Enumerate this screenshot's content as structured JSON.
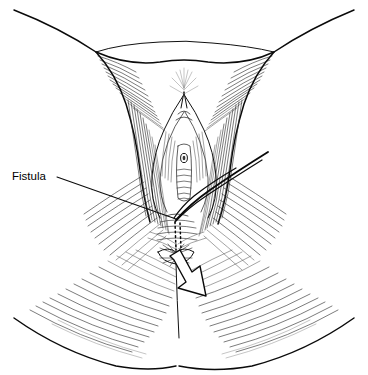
{
  "figure": {
    "domain": "medical-illustration",
    "style": "pen-and-ink line drawing, black on white",
    "title_visible": "",
    "background_color": "#ffffff",
    "ink_color": "#0a0a0a",
    "width_px": 368,
    "height_px": 375
  },
  "annotations": {
    "labels": [
      {
        "id": "fistula",
        "text": "Fistula",
        "text_x": 12,
        "text_y": 177,
        "font_size_px": 11.5,
        "color": "#000000",
        "leader_from_x": 57,
        "leader_from_y": 177,
        "leader_to_x": 176,
        "leader_to_y": 219
      }
    ],
    "arrow": {
      "id": "fistula-tract-arrow",
      "description": "hollow outlined arrow indicating fistula tract direction",
      "points_toward": "down-right",
      "tip_x": 206,
      "tip_y": 296,
      "tail_x": 172,
      "tail_y": 258,
      "fill": "#ffffff",
      "stroke": "#0a0a0a"
    },
    "tract": {
      "id": "fistula-tract",
      "description": "dotted line marking the subcutaneous fistula tract",
      "style": "dotted",
      "x": 176,
      "y_top": 222,
      "y_bottom": 250
    }
  },
  "anatomy": {
    "regions": [
      {
        "id": "mons-pubis",
        "label": "mons pubis",
        "cx": 184,
        "cy": 70
      },
      {
        "id": "left-thigh",
        "label": "left inner thigh",
        "cx": 70,
        "cy": 150
      },
      {
        "id": "right-thigh",
        "label": "right inner thigh",
        "cx": 296,
        "cy": 150
      },
      {
        "id": "labia-majora",
        "label": "labia majora",
        "cx": 184,
        "cy": 170
      },
      {
        "id": "vestibule",
        "label": "vaginal vestibule",
        "cx": 180,
        "cy": 185
      },
      {
        "id": "perineum",
        "label": "perineal body",
        "cx": 178,
        "cy": 235
      },
      {
        "id": "anus",
        "label": "anal verge",
        "cx": 176,
        "cy": 258
      },
      {
        "id": "left-buttock",
        "label": "left buttock",
        "cx": 95,
        "cy": 310
      },
      {
        "id": "right-buttock",
        "label": "right buttock",
        "cx": 270,
        "cy": 310
      }
    ],
    "instrument": {
      "id": "probe",
      "label": "surgical probe / retractor",
      "from_x": 268,
      "from_y": 152,
      "to_x": 172,
      "to_y": 222
    }
  }
}
